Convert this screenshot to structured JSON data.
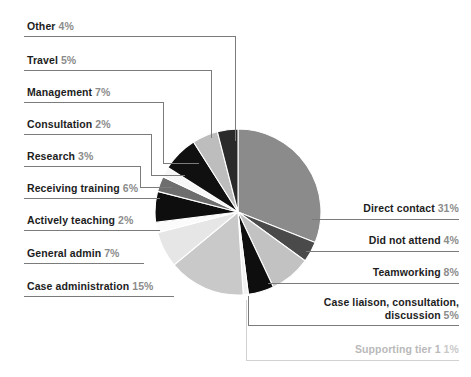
{
  "chart_data": {
    "type": "pie",
    "title": "",
    "legend_position": "outside-leader-lines",
    "unit": "%",
    "total": 100,
    "categories": [
      "Direct contact",
      "Did not attend",
      "Teamworking",
      "Case liaison, consultation, discussion",
      "Supporting tier 1",
      "Case administration",
      "General admin",
      "Actively teaching",
      "Receiving training",
      "Research",
      "Consultation",
      "Management",
      "Travel",
      "Other"
    ],
    "values": [
      31,
      4,
      8,
      5,
      1,
      15,
      7,
      2,
      6,
      3,
      2,
      7,
      5,
      4
    ],
    "colors": [
      "#8b8b8b",
      "#4a4a4a",
      "#c2c2c2",
      "#0e0e0e",
      "#f2f2f2",
      "#c9c9c9",
      "#e6e6e6",
      "#fbfbfb",
      "#0e0e0e",
      "#6e6e6e",
      "#f7f7f7",
      "#101010",
      "#bdbdbd",
      "#2a2a2a"
    ],
    "start_angle_deg": 0,
    "direction": "clockwise"
  },
  "labels_left": [
    {
      "name": "Other",
      "pct": "4%"
    },
    {
      "name": "Travel",
      "pct": "5%"
    },
    {
      "name": "Management",
      "pct": "7%"
    },
    {
      "name": "Consultation",
      "pct": "2%"
    },
    {
      "name": "Research",
      "pct": "3%"
    },
    {
      "name": "Receiving training",
      "pct": "6%"
    },
    {
      "name": "Actively teaching",
      "pct": "2%"
    },
    {
      "name": "General admin",
      "pct": "7%"
    },
    {
      "name": "Case administration",
      "pct": "15%"
    }
  ],
  "labels_right": [
    {
      "name": "Direct contact",
      "pct": "31%"
    },
    {
      "name": "Did not attend",
      "pct": "4%"
    },
    {
      "name": "Teamworking",
      "pct": "8%"
    },
    {
      "name": "Case liaison, consultation, discussion",
      "pct": "5%"
    },
    {
      "name": "Supporting tier 1",
      "pct": "1%"
    }
  ],
  "style": {
    "text_color": "#1d1d1d",
    "percent_color": "#8c8c8c",
    "muted_color": "#b9b9b9",
    "leader_color": "#7b7b7b",
    "background": "#ffffff"
  }
}
